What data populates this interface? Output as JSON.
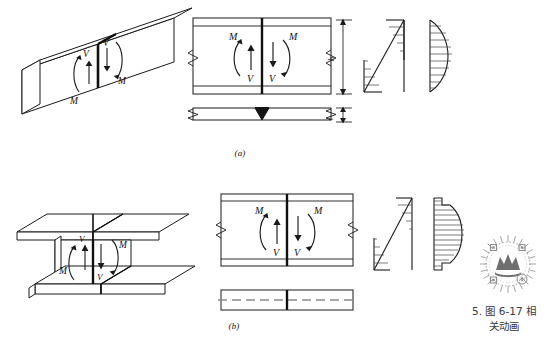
{
  "figure": {
    "title_visible": false,
    "panels": [
      {
        "id": "a",
        "caption": "(a)",
        "section_type": "rectangular-plate-beam",
        "isometric_label": "rectangular beam splice isometric",
        "forces": [
          {
            "symbol": "M",
            "meaning": "bending-moment",
            "side": "left"
          },
          {
            "symbol": "V",
            "meaning": "shear-force",
            "side": "left"
          },
          {
            "symbol": "V",
            "meaning": "shear-force",
            "side": "right"
          },
          {
            "symbol": "M",
            "meaning": "bending-moment",
            "side": "right"
          }
        ],
        "dimension_labels": [
          {
            "symbol": "h",
            "meaning": "section-depth"
          },
          {
            "symbol": "t",
            "meaning": "plate-thickness"
          }
        ],
        "stress_diagrams": [
          {
            "name": "bending-stress",
            "shape": "linear-antisymmetric"
          },
          {
            "name": "shear-stress",
            "shape": "parabolic"
          }
        ]
      },
      {
        "id": "b",
        "caption": "(b)",
        "section_type": "i-beam",
        "isometric_label": "I-beam splice isometric",
        "forces": [
          {
            "symbol": "M",
            "meaning": "bending-moment",
            "side": "left"
          },
          {
            "symbol": "V",
            "meaning": "shear-force",
            "side": "left"
          },
          {
            "symbol": "V",
            "meaning": "shear-force",
            "side": "right"
          },
          {
            "symbol": "M",
            "meaning": "bending-moment",
            "side": "right"
          }
        ],
        "dimension_labels": [],
        "stress_diagrams": [
          {
            "name": "bending-stress",
            "shape": "linear-antisymmetric"
          },
          {
            "name": "shear-stress",
            "shape": "stepped-parabolic"
          }
        ]
      }
    ]
  },
  "annotation": {
    "item_number": "5.",
    "figure_ref": "图 6-17 相",
    "figure_ref_line2": "关动画",
    "full_text": "5. 图 6-17 相关动画",
    "badge_name": "animation-qr-badge"
  },
  "symbols": {
    "moment": "M",
    "shear": "V",
    "depth": "h",
    "thickness": "t"
  },
  "colors": {
    "line": "#1a1a1a",
    "weld_fill": "#141414",
    "light_line": "#6d6d6d",
    "text": "#333333",
    "badge": "#9a9a9a"
  }
}
